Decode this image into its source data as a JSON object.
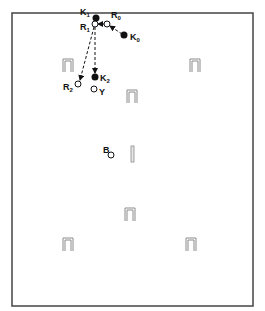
{
  "diagram": {
    "frame": {
      "x": 12,
      "y": 13,
      "width": 241,
      "height": 293,
      "stroke": "#444444"
    },
    "filled_points": [
      {
        "id": "K1",
        "label": "K",
        "sub": "1",
        "x": 96,
        "y": 18,
        "lx": 80,
        "ly": 15
      },
      {
        "id": "K0",
        "label": "K",
        "sub": "0",
        "x": 124,
        "y": 35,
        "lx": 130,
        "ly": 40
      },
      {
        "id": "K2",
        "label": "K",
        "sub": "2",
        "x": 95,
        "y": 77,
        "lx": 100,
        "ly": 81
      }
    ],
    "open_points": [
      {
        "id": "R0",
        "label": "R",
        "sub": "0",
        "x": 107,
        "y": 24,
        "lx": 111,
        "ly": 18
      },
      {
        "id": "R1",
        "label": "R",
        "sub": "1",
        "x": 95,
        "y": 24,
        "lx": 80,
        "ly": 30
      },
      {
        "id": "R2",
        "label": "R",
        "sub": "2",
        "x": 78,
        "y": 84,
        "lx": 63,
        "ly": 90
      },
      {
        "id": "Y",
        "label": "Y",
        "sub": "",
        "x": 94,
        "y": 89,
        "lx": 99,
        "ly": 95
      },
      {
        "id": "B",
        "label": "B",
        "sub": "",
        "x": 111,
        "y": 155,
        "lx": 103,
        "ly": 153
      }
    ],
    "arrows": [
      {
        "from": "K0",
        "to": "R0",
        "x1": 122,
        "y1": 34,
        "x2": 110,
        "y2": 26
      },
      {
        "from": "R0",
        "to": "R1",
        "x1": 104,
        "y1": 24,
        "x2": 98,
        "y2": 24
      },
      {
        "from": "R1",
        "to": "K2",
        "x1": 95,
        "y1": 27,
        "x2": 95,
        "y2": 73
      },
      {
        "from": "R1",
        "to": "R2",
        "x1": 94,
        "y1": 27,
        "x2": 80,
        "y2": 80
      }
    ],
    "landmarks": [
      {
        "id": "gate-1",
        "x": 63,
        "y": 59,
        "w": 10,
        "h": 13
      },
      {
        "id": "gate-2",
        "x": 190,
        "y": 59,
        "w": 10,
        "h": 13
      },
      {
        "id": "gate-3",
        "x": 127,
        "y": 90,
        "w": 10,
        "h": 13
      },
      {
        "id": "gate-4",
        "x": 125,
        "y": 208,
        "w": 10,
        "h": 13
      },
      {
        "id": "gate-5",
        "x": 63,
        "y": 238,
        "w": 10,
        "h": 13
      },
      {
        "id": "gate-6",
        "x": 186,
        "y": 238,
        "w": 10,
        "h": 13
      }
    ],
    "bar": {
      "id": "bar",
      "x": 131,
      "y": 146,
      "w": 3,
      "h": 16
    }
  }
}
